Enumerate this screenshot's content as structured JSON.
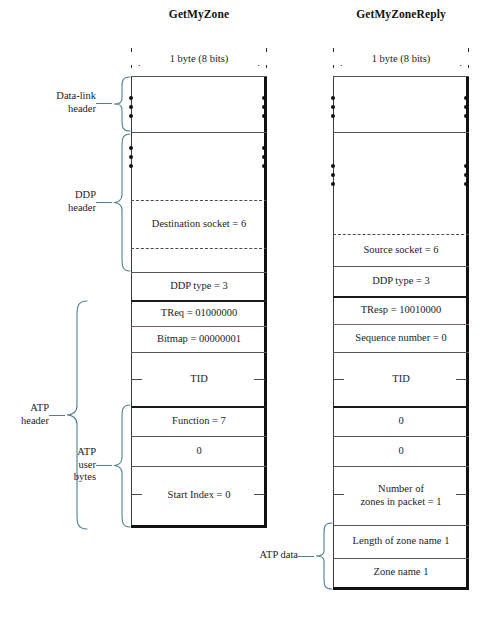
{
  "figure": {
    "byte_width_label": "1 byte (8 bits)",
    "brace_color": "#4e7f8c",
    "accent_rule_color": "#7d5f74",
    "edge_color": "#111111"
  },
  "packets": [
    {
      "id": "getmyzone",
      "title": "GetMyZone",
      "rows": [
        {
          "name": "datalink-blank-top",
          "label": ""
        },
        {
          "name": "datalink-ellipsis",
          "label": ""
        },
        {
          "name": "ddp-blank-upper",
          "label": ""
        },
        {
          "name": "ddp-ellipsis",
          "label": ""
        },
        {
          "name": "destination-socket",
          "label": "Destination socket = 6"
        },
        {
          "name": "ddp-blank-lower",
          "label": ""
        },
        {
          "name": "ddp-type",
          "label": "DDP type = 3"
        },
        {
          "name": "treq",
          "label": "TReq = 01000000"
        },
        {
          "name": "bitmap",
          "label": "Bitmap = 00000001"
        },
        {
          "name": "tid",
          "label": "TID"
        },
        {
          "name": "function",
          "label": "Function = 7"
        },
        {
          "name": "zero",
          "label": "0"
        },
        {
          "name": "start-index",
          "label": "Start Index = 0"
        }
      ],
      "groups": [
        {
          "name": "data-link-header",
          "label": "Data-link\nheader"
        },
        {
          "name": "ddp-header",
          "label": "DDP\nheader"
        },
        {
          "name": "atp-header",
          "label": "ATP\nheader"
        },
        {
          "name": "atp-user-bytes",
          "label": "ATP\nuser\nbytes"
        }
      ]
    },
    {
      "id": "getmyzonereply",
      "title": "GetMyZoneReply",
      "rows": [
        {
          "name": "datalink-blank-top",
          "label": ""
        },
        {
          "name": "datalink-ellipsis",
          "label": ""
        },
        {
          "name": "ddp-blank-upper",
          "label": ""
        },
        {
          "name": "ddp-ellipsis",
          "label": ""
        },
        {
          "name": "source-socket",
          "label": "Source socket = 6"
        },
        {
          "name": "ddp-type",
          "label": "DDP type = 3"
        },
        {
          "name": "tresp",
          "label": "TResp = 10010000"
        },
        {
          "name": "sequence-number",
          "label": "Sequence number = 0"
        },
        {
          "name": "tid",
          "label": "TID"
        },
        {
          "name": "zero-1",
          "label": "0"
        },
        {
          "name": "zero-2",
          "label": "0"
        },
        {
          "name": "number-of-zones",
          "label": "Number of\nzones in packet = 1"
        },
        {
          "name": "length-of-zone-name",
          "label": "Length of zone name 1"
        },
        {
          "name": "zone-name",
          "label": "Zone name 1"
        }
      ],
      "groups": [
        {
          "name": "atp-data",
          "label": "ATP data"
        }
      ]
    }
  ]
}
